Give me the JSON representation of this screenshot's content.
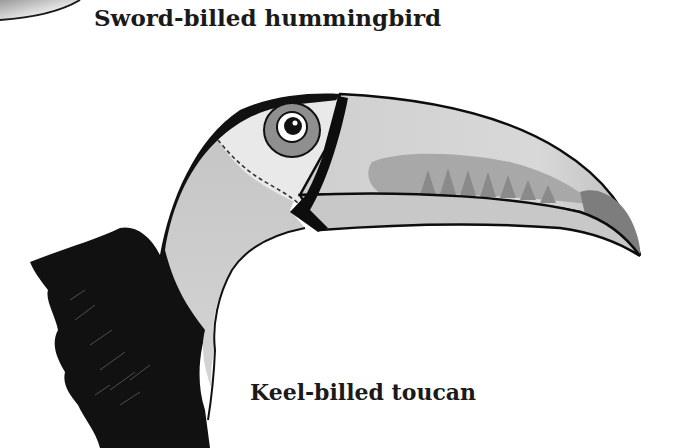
{
  "illustration": {
    "labels": {
      "top": "Sword-billed hummingbird",
      "bottom": "Keel-billed toucan"
    },
    "subjects": [
      "sword-billed-hummingbird-bill-fragment",
      "keel-billed-toucan-head"
    ],
    "palette": {
      "background": "#ffffff",
      "outline": "#0d0d0d",
      "plumage_black": "#111111",
      "throat_light": "#c9c9c9",
      "face_pale": "#e6e6e6",
      "eye_ring": "#8f8f8f",
      "bill_light": "#d2d2d2",
      "bill_mid": "#a9a9a9",
      "bill_tip": "#7d7d7d",
      "label_text": "#1a1a1a"
    }
  }
}
